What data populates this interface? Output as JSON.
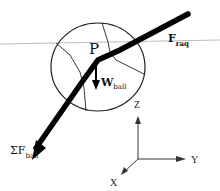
{
  "diagram": {
    "point_label": "P",
    "forces": [
      {
        "name": "F",
        "subscript": "raq"
      },
      {
        "name": "W",
        "subscript": "ball"
      },
      {
        "name": "ΣF",
        "subscript": "ball"
      }
    ],
    "axes": {
      "z": "Z",
      "y": "Y",
      "x": "X"
    }
  }
}
